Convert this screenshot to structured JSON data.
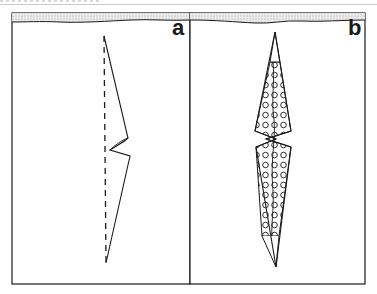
{
  "figure": {
    "panels": [
      {
        "label": "a",
        "description": "Folded strip outline with dashed center fold line; solid line zigzags out to a notch at mid-height",
        "frame": {
          "x": 12,
          "y": 13,
          "width": 178,
          "height": 271
        }
      },
      {
        "label": "b",
        "description": "Elongated diamond with double notch at mid-height, body filled with circle (dotted) pattern; plain tips top and bottom",
        "frame": {
          "x": 190,
          "y": 13,
          "width": 175,
          "height": 271
        }
      }
    ],
    "colors": {
      "line": "#1a1a1a",
      "band": "#d8d8d8",
      "background": "#ffffff"
    }
  }
}
